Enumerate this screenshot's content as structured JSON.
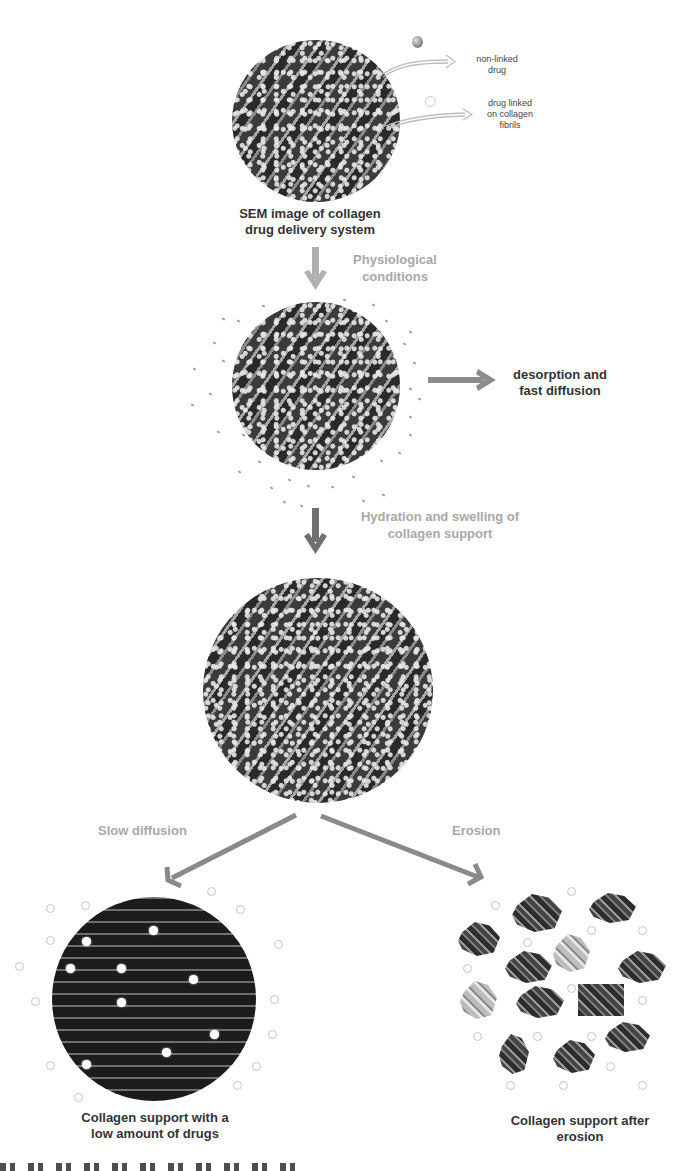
{
  "legend": {
    "non_linked": "non-linked drug",
    "non_linked_line1": "non-linked",
    "non_linked_line2": "drug",
    "linked_line1": "drug linked",
    "linked_line2": "on collagen",
    "linked_line3": "fibrils"
  },
  "stages": {
    "sem": {
      "line1": "SEM image of collagen",
      "line2": "drug delivery system"
    },
    "physiological": {
      "line1": "Physiological",
      "line2": "conditions"
    },
    "desorption": {
      "line1": "desorption and",
      "line2": "fast diffusion"
    },
    "hydration": {
      "line1": "Hydration and swelling of",
      "line2": "collagen support"
    },
    "slow_diffusion": "Slow diffusion",
    "erosion": "Erosion",
    "low_drugs": {
      "line1": "Collagen support with a",
      "line2": "low amount of drugs"
    },
    "after_erosion": {
      "line1": "Collagen support after",
      "line2": "erosion"
    }
  },
  "colors": {
    "arrow_light": "#b0b0b0",
    "arrow_mid": "#8c8c8c",
    "arrow_dark": "#707070",
    "text_dark": "#333333",
    "text_gray": "#a8a8a8"
  }
}
